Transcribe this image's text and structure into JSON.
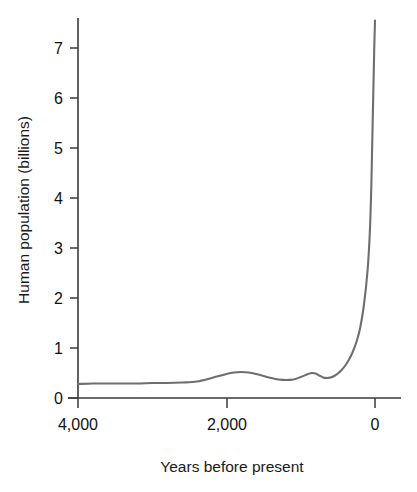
{
  "chart_data": {
    "type": "line",
    "title": "",
    "xlabel": "Years before present",
    "ylabel": "Human population (billions)",
    "xlim": [
      4000,
      0
    ],
    "ylim": [
      0,
      7.6
    ],
    "x_ticks": [
      4000,
      2000,
      0
    ],
    "x_tick_labels": [
      "4,000",
      "2,000",
      "0"
    ],
    "y_ticks": [
      0,
      1,
      2,
      3,
      4,
      5,
      6,
      7
    ],
    "y_tick_labels": [
      "0",
      "1",
      "2",
      "3",
      "4",
      "5",
      "6",
      "7"
    ],
    "grid": false,
    "legend": "none",
    "series": [
      {
        "name": "Human population",
        "color": "#6e6e6e",
        "x": [
          4000,
          3800,
          3600,
          3400,
          3200,
          3000,
          2800,
          2600,
          2400,
          2200,
          2000,
          1900,
          1800,
          1700,
          1600,
          1500,
          1400,
          1300,
          1200,
          1100,
          1000,
          900,
          850,
          800,
          750,
          700,
          650,
          600,
          550,
          500,
          450,
          400,
          350,
          300,
          250,
          200,
          150,
          100,
          70,
          50,
          40,
          30,
          20,
          10,
          0
        ],
        "y": [
          0.28,
          0.29,
          0.29,
          0.29,
          0.29,
          0.3,
          0.3,
          0.31,
          0.33,
          0.4,
          0.48,
          0.51,
          0.52,
          0.51,
          0.48,
          0.44,
          0.4,
          0.37,
          0.36,
          0.37,
          0.42,
          0.48,
          0.5,
          0.49,
          0.45,
          0.41,
          0.4,
          0.41,
          0.44,
          0.49,
          0.56,
          0.65,
          0.77,
          0.92,
          1.12,
          1.4,
          1.85,
          2.55,
          3.3,
          4.2,
          4.9,
          5.6,
          6.3,
          7.0,
          7.55
        ]
      }
    ]
  },
  "axes": {
    "y_axis_label": "Human population (billions)",
    "x_axis_label": "Years before present"
  }
}
